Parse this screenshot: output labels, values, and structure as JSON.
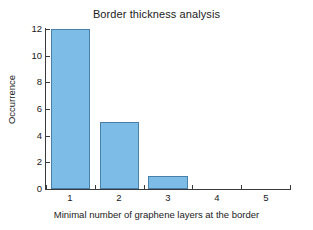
{
  "chart_data": {
    "type": "bar",
    "title": "Border thickness analysis",
    "xlabel": "Minimal number of graphene layers at the border",
    "ylabel": "Occurrence",
    "categories": [
      "1",
      "2",
      "3",
      "4",
      "5"
    ],
    "values": [
      12,
      5,
      1,
      0,
      0
    ],
    "xtick_labels": [
      "1",
      "2",
      "3",
      "4",
      "5"
    ],
    "ytick_labels": [
      "0",
      "2",
      "4",
      "6",
      "8",
      "10",
      "12"
    ],
    "ytick_values": [
      0,
      2,
      4,
      6,
      8,
      10,
      12
    ],
    "ylim": [
      0,
      12
    ],
    "xlim": [
      0.5,
      5.5
    ],
    "grid": false,
    "legend": "none",
    "bar_fill_color": "#7ebce8",
    "bar_edge_color": "#4a7fa8",
    "axis_color": "#3a3a3a",
    "background_color": "#ffffff"
  }
}
